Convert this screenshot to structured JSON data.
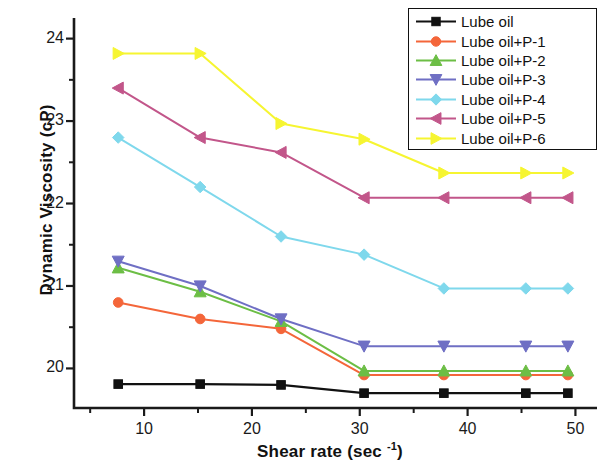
{
  "chart_data": {
    "type": "line",
    "title": "",
    "xlabel": "Shear rate (sec -1)",
    "xlabel_main": "Shear rate (sec ",
    "xlabel_sup": "-1",
    "xlabel_end": ")",
    "ylabel": "Dynamic Viscosity (cP)",
    "xlim": [
      3.5,
      52.0
    ],
    "ylim": [
      19.52,
      24.25
    ],
    "xticks": [
      10,
      20,
      30,
      40,
      50
    ],
    "yticks": [
      20,
      21,
      22,
      23,
      24
    ],
    "xminorticks": [
      5,
      15,
      25,
      35,
      45
    ],
    "yminorticks": [
      20.5,
      21.5,
      22.5,
      23.5
    ],
    "grid": false,
    "legend_position": "top-right",
    "x": [
      7.6,
      15.2,
      22.7,
      30.4,
      37.8,
      45.4,
      49.3
    ],
    "series": [
      {
        "name": "Lube oil",
        "color": "#111111",
        "marker": "square",
        "values": [
          19.81,
          19.81,
          19.8,
          19.7,
          19.7,
          19.7,
          19.7
        ]
      },
      {
        "name": "Lube oil+P-1",
        "color": "#F4663A",
        "marker": "circle",
        "values": [
          20.8,
          20.6,
          20.48,
          19.92,
          19.92,
          19.92,
          19.92
        ]
      },
      {
        "name": "Lube oil+P-2",
        "color": "#6CBE45",
        "marker": "triangle-up",
        "values": [
          21.22,
          20.93,
          20.57,
          19.97,
          19.97,
          19.97,
          19.97
        ]
      },
      {
        "name": "Lube oil+P-3",
        "color": "#6F6FC4",
        "marker": "triangle-down",
        "values": [
          21.3,
          21.0,
          20.6,
          20.27,
          20.27,
          20.27,
          20.27
        ]
      },
      {
        "name": "Lube oil+P-4",
        "color": "#7FD8EC",
        "marker": "diamond",
        "values": [
          22.8,
          22.2,
          21.6,
          21.38,
          20.97,
          20.97,
          20.97
        ]
      },
      {
        "name": "Lube oil+P-5",
        "color": "#C2568A",
        "marker": "triangle-left",
        "values": [
          23.4,
          22.8,
          22.62,
          22.07,
          22.07,
          22.07,
          22.07
        ]
      },
      {
        "name": "Lube oil+P-6",
        "color": "#F6F531",
        "marker": "triangle-right",
        "values": [
          23.82,
          23.82,
          22.97,
          22.78,
          22.37,
          22.37,
          22.37
        ]
      }
    ]
  },
  "legend": {
    "items": [
      "Lube oil",
      "Lube oil+P-1",
      "Lube oil+P-2",
      "Lube oil+P-3",
      "Lube oil+P-4",
      "Lube oil+P-5",
      "Lube oil+P-6"
    ]
  },
  "axis": {
    "x_tick_labels": [
      "10",
      "20",
      "30",
      "40",
      "50"
    ],
    "y_tick_labels": [
      "20",
      "21",
      "22",
      "23",
      "24"
    ]
  }
}
